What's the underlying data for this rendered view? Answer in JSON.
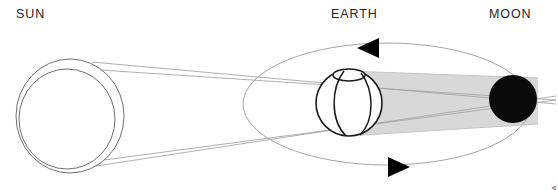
{
  "diagram": {
    "labels": {
      "sun": "SUN",
      "earth": "EARTH",
      "moon": "MOON"
    },
    "credit": "© Ed Noriega",
    "colors": {
      "background": "#ffffff",
      "outline": "#6e6e6e",
      "ray": "#a8a8a8",
      "earth_outline": "#1a1a1a",
      "shadow": "#d8d8d8",
      "shadow_edge": "#c9c9c9",
      "moon_fill": "#0a0a0a",
      "orbit": "#9a9a9a",
      "arrow": "#000000",
      "label_text": "#262626"
    },
    "sun": {
      "outer_circle": {
        "cx": 70,
        "cy": 116,
        "rx": 54,
        "ry": 57
      },
      "inner_circle": {
        "cx": 67,
        "cy": 119,
        "rx": 48,
        "ry": 50
      }
    },
    "earth": {
      "sphere": {
        "cx": 349,
        "cy": 103,
        "r": 33
      },
      "polar_cap": {
        "cx": 349,
        "cy": 75,
        "rx": 16,
        "ry": 6
      },
      "meridians": 2
    },
    "moon": {
      "circle": {
        "cx": 513,
        "cy": 99,
        "r": 24
      },
      "phase": "eclipsed"
    },
    "orbit": {
      "shape": "ellipse",
      "cx": 387,
      "cy": 104,
      "rx": 144,
      "ry": 61,
      "direction": "counterclockwise",
      "arrows": [
        {
          "name": "orbit-arrow-top",
          "x": 368,
          "y": 48,
          "points": "left"
        },
        {
          "name": "orbit-arrow-bottom",
          "x": 399,
          "y": 167,
          "points": "right"
        }
      ]
    },
    "shadow_cone": {
      "description": "Earth umbral shadow cast toward the Moon",
      "from": "earth",
      "to": "moon"
    },
    "light_rays": {
      "count": 4,
      "description": "Tangent sunlight rays from Sun limbs past Earth"
    }
  }
}
